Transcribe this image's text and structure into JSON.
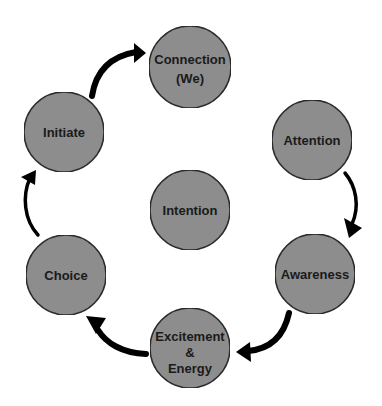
{
  "diagram": {
    "type": "cycle",
    "colors": {
      "node_fill": "#8f8f8f",
      "node_stroke": "#2a2a2a",
      "arrow": "#000000",
      "text": "#1a1a1a",
      "background": "#ffffff"
    },
    "center": {
      "id": "intention",
      "lines": [
        "Intention"
      ]
    },
    "nodes": [
      {
        "id": "connection",
        "lines": [
          "Connection",
          "(We)"
        ]
      },
      {
        "id": "attention",
        "lines": [
          "Attention"
        ]
      },
      {
        "id": "awareness",
        "lines": [
          "Awareness"
        ]
      },
      {
        "id": "excitement",
        "lines": [
          "Excitement",
          "&",
          "Energy"
        ]
      },
      {
        "id": "choice",
        "lines": [
          "Choice"
        ]
      },
      {
        "id": "initiate",
        "lines": [
          "Initiate"
        ]
      }
    ],
    "edges": [
      {
        "from": "initiate",
        "to": "connection"
      },
      {
        "from": "attention",
        "to": "awareness"
      },
      {
        "from": "awareness",
        "to": "excitement"
      },
      {
        "from": "excitement",
        "to": "choice"
      },
      {
        "from": "choice",
        "to": "initiate"
      }
    ]
  }
}
